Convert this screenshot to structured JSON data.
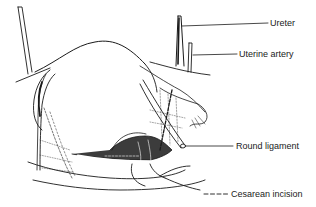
{
  "figure": {
    "labels": [
      {
        "id": "ureter",
        "text": "Ureter"
      },
      {
        "id": "uterine-artery",
        "text": "Uterine artery"
      },
      {
        "id": "round-ligament",
        "text": "Round ligament"
      },
      {
        "id": "cesarean-incision",
        "text": "Cesarean incision"
      }
    ],
    "legend": {
      "symbol": "dashed-line",
      "text": "Cesarean incision"
    },
    "colors": {
      "ink": "#1a1a1a",
      "background": "#ffffff"
    }
  }
}
